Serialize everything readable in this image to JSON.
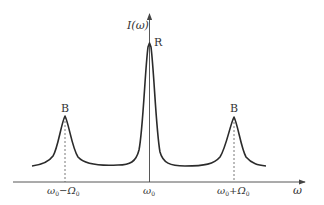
{
  "figure": {
    "type": "spectrum-diagram",
    "y_axis_label": "I(ω)",
    "x_axis_label": "ω",
    "peaks": [
      {
        "label": "B",
        "position_label": "ω₀−Ω₀",
        "relative_height": 0.42
      },
      {
        "label": "R",
        "position_label": "ω₀",
        "relative_height": 1.0
      },
      {
        "label": "B",
        "position_label": "ω₀+Ω₀",
        "relative_height": 0.41
      }
    ],
    "tick_labels": {
      "left": {
        "base": "ω",
        "base_sub": "0",
        "op": "−",
        "shift": "Ω",
        "shift_sub": "0"
      },
      "mid": {
        "base": "ω",
        "base_sub": "0"
      },
      "right": {
        "base": "ω",
        "base_sub": "0",
        "op": "+",
        "shift": "Ω",
        "shift_sub": "0"
      }
    },
    "colors": {
      "curve": "#2b2b2b",
      "axis": "#444444",
      "dashed": "#555555"
    }
  }
}
